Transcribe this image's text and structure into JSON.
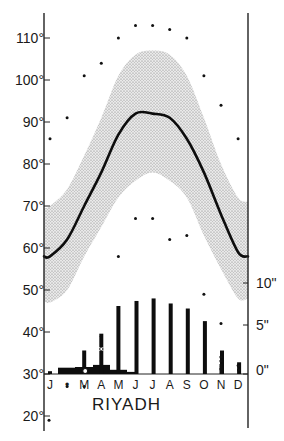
{
  "chart_data": {
    "type": "line",
    "title": "RIYADH",
    "subtype": "climograph",
    "categories": [
      "J",
      "F",
      "M",
      "A",
      "M",
      "J",
      "J",
      "A",
      "S",
      "O",
      "N",
      "D"
    ],
    "month_label_display": [
      "J",
      "•",
      "M",
      "A",
      "M",
      "J",
      "J",
      "A",
      "S",
      "O",
      "N",
      "D"
    ],
    "left_axis": {
      "label": "Temperature (°F)",
      "ticks": [
        "20°",
        "30°",
        "40°",
        "50°",
        "60°",
        "70°",
        "80°",
        "90°",
        "100°",
        "110°"
      ],
      "tick_values": [
        20,
        30,
        40,
        50,
        60,
        70,
        80,
        90,
        100,
        110
      ],
      "ylim": [
        18,
        115
      ]
    },
    "right_axis": {
      "label": "Precipitation (in)",
      "ticks": [
        "0\"",
        "5\"",
        "10\""
      ],
      "tick_values": [
        0,
        5,
        10
      ],
      "ylim": [
        0,
        10
      ]
    },
    "series": [
      {
        "name": "Mean monthly temperature",
        "kind": "line",
        "values": [
          58,
          62,
          70,
          78,
          87,
          92,
          92,
          91,
          86,
          78,
          68,
          59
        ]
      },
      {
        "name": "Mean daily max (band upper)",
        "kind": "band_upper",
        "values": [
          70,
          74,
          82,
          91,
          101,
          106,
          107,
          106,
          101,
          91,
          80,
          72
        ]
      },
      {
        "name": "Mean daily min (band lower)",
        "kind": "band_lower",
        "values": [
          47,
          50,
          58,
          65,
          72,
          76,
          78,
          76,
          72,
          63,
          55,
          48
        ]
      },
      {
        "name": "Absolute maximum",
        "kind": "dots",
        "values": [
          86,
          91,
          101,
          104,
          110,
          113,
          113,
          112,
          110,
          101,
          94,
          86
        ]
      },
      {
        "name": "Absolute minimum",
        "kind": "dots",
        "values": [
          19,
          27,
          27,
          39,
          58,
          67,
          67,
          62,
          63,
          49,
          42,
          32
        ]
      },
      {
        "name": "Monthly precipitation (in)",
        "kind": "bars",
        "values": [
          0.1,
          0.7,
          1.0,
          1.0,
          0.1,
          0,
          0,
          0,
          0,
          0,
          0.1,
          0.05
        ]
      },
      {
        "name": "Mean monthly humidity/range bars",
        "kind": "thin_bars",
        "values": [
          0.6,
          0.7,
          2.8,
          4.8,
          7.5,
          8.1,
          8.4,
          7.8,
          7.2,
          5.7,
          2.2,
          0.8
        ]
      }
    ],
    "grid": false,
    "legend": "none"
  }
}
